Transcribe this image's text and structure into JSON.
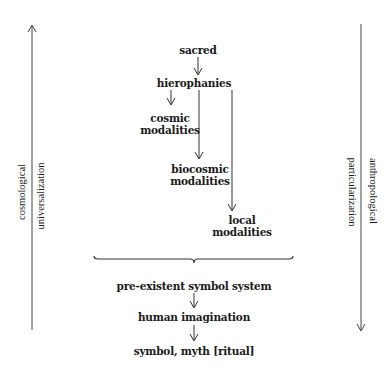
{
  "diagram": {
    "top_chain": {
      "sacred": "sacred",
      "hierophanies": "hierophanies",
      "cosmic_modalities": [
        "cosmic",
        "modalities"
      ],
      "biocosmic_modalities": [
        "biocosmic",
        "modalities"
      ],
      "local_modalities": [
        "local",
        "modalities"
      ]
    },
    "bottom_chain": {
      "symbol_system": "pre-existent symbol system",
      "imagination": "human imagination",
      "output": "symbol, myth [ritual]"
    },
    "left_axis": {
      "direction": "up",
      "labels": [
        "cosmological",
        "universalization"
      ]
    },
    "right_axis": {
      "direction": "down",
      "labels": [
        "anthropological",
        "particularization"
      ]
    },
    "colors": {
      "line": "#333333",
      "text": "#1a1a1a",
      "background": "#ffffff"
    }
  }
}
